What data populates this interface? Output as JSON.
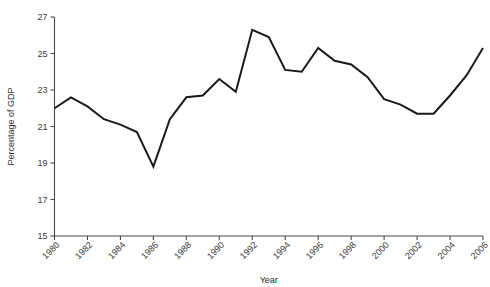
{
  "chart_data": {
    "type": "line",
    "title": "",
    "xlabel": "Year",
    "ylabel": "Percentage of GDP",
    "xlim": [
      1980,
      2006
    ],
    "ylim": [
      15,
      27
    ],
    "grid": false,
    "legend": false,
    "x_tick_labels": [
      "1980",
      "1982",
      "1984",
      "1986",
      "1988",
      "1990",
      "1992",
      "1994",
      "1996",
      "1998",
      "2000",
      "2002",
      "2004",
      "2006"
    ],
    "x_ticks": [
      1980,
      1982,
      1984,
      1986,
      1988,
      1990,
      1992,
      1994,
      1996,
      1998,
      2000,
      2002,
      2004,
      2006
    ],
    "y_tick_labels": [
      "15",
      "17",
      "19",
      "21",
      "23",
      "25",
      "27"
    ],
    "y_ticks": [
      15,
      17,
      19,
      21,
      23,
      25,
      27
    ],
    "x": [
      1980,
      1981,
      1982,
      1983,
      1984,
      1985,
      1986,
      1987,
      1988,
      1989,
      1990,
      1991,
      1992,
      1993,
      1994,
      1995,
      1996,
      1997,
      1998,
      1999,
      2000,
      2001,
      2002,
      2003,
      2004,
      2005,
      2006
    ],
    "series": [
      {
        "name": "Percentage of GDP",
        "color": "#1a1a1a",
        "values": [
          22.0,
          22.6,
          22.1,
          21.4,
          21.1,
          20.7,
          18.8,
          21.4,
          22.6,
          22.7,
          23.6,
          22.9,
          26.3,
          25.9,
          24.1,
          24.0,
          25.3,
          24.6,
          24.4,
          23.7,
          22.5,
          22.2,
          21.7,
          21.7,
          22.7,
          23.8,
          25.3
        ]
      }
    ]
  },
  "axes": {
    "x_title": "Year",
    "y_title": "Percentage of GDP"
  },
  "colors": {
    "line": "#1a1a1a",
    "axis": "#4a4a4a",
    "background": "#ffffff",
    "text": "#3a3a3a"
  }
}
